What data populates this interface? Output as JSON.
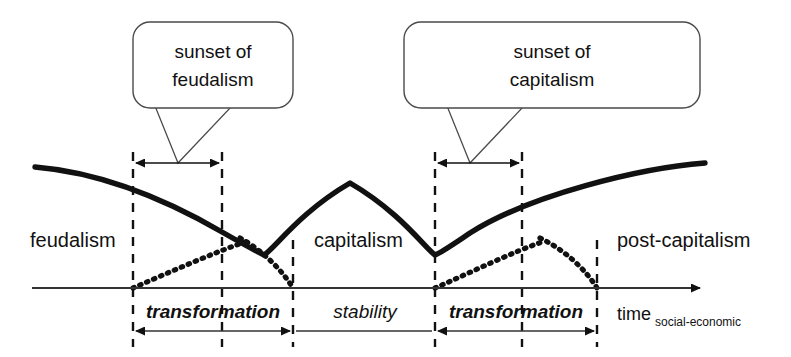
{
  "diagram": {
    "title_visible": false,
    "colors": {
      "ink": "#111111",
      "curve_solid": "#111111",
      "curve_dotted": "#111111",
      "guide": "#333333",
      "background": "#ffffff"
    },
    "callouts": [
      {
        "id": "callout-sunset-feudalism",
        "line1": "sunset of",
        "line2": "feudalism"
      },
      {
        "id": "callout-sunset-capitalism",
        "line1": "sunset of",
        "line2": "capitalism"
      }
    ],
    "eras": [
      {
        "id": "era-feudalism",
        "label": "feudalism"
      },
      {
        "id": "era-capitalism",
        "label": "capitalism"
      },
      {
        "id": "era-post-capitalism",
        "label": "post-capitalism"
      }
    ],
    "phases": [
      {
        "id": "phase-transformation-1",
        "label": "transformation",
        "emphasis": "bold-italic"
      },
      {
        "id": "phase-stability",
        "label": "stability",
        "emphasis": "italic"
      },
      {
        "id": "phase-transformation-2",
        "label": "transformation",
        "emphasis": "bold-italic"
      }
    ],
    "axis": {
      "label": "time",
      "subscript": "social-economic",
      "direction": "right"
    }
  }
}
